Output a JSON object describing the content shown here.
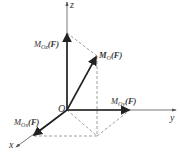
{
  "diagram": {
    "type": "3d-moment-vector-decomposition",
    "origin_label": "O",
    "axes": {
      "x": "x",
      "y": "y",
      "z": "z"
    },
    "vectors": {
      "resultant": {
        "M": "M",
        "sub": "O",
        "arg": "(F)"
      },
      "mx": {
        "M": "M",
        "sub": "Ox",
        "arg": "(F)"
      },
      "my": {
        "M": "M",
        "sub": "Oy",
        "arg": "(F)"
      },
      "mz": {
        "M": "M",
        "sub": "Oz",
        "arg": "(F)"
      }
    },
    "colors": {
      "axis": "#555555",
      "vector": "#222222",
      "dashed": "#888888"
    }
  }
}
